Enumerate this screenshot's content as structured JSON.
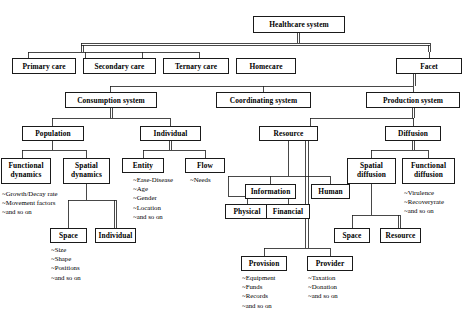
{
  "diagram": {
    "type": "tree-diagram",
    "nodes": {
      "healthcare_system": "Healthcare system",
      "primary_care": "Primary care",
      "secondary_care": "Secondary care",
      "ternary_care": "Ternary care",
      "homecare": "Homecare",
      "facet": "Facet",
      "consumption_system": "Consumption system",
      "coordinating_system": "Coordinating system",
      "production_system": "Production system",
      "population": "Population",
      "individual": "Individual",
      "resource": "Resource",
      "diffusion": "Diffusion",
      "functional_dynamics_l1": "Functional",
      "functional_dynamics_l2": "dynamics",
      "spatial_dynamics_l1": "Spatial",
      "spatial_dynamics_l2": "dynamics",
      "entity": "Entity",
      "flow": "Flow",
      "spatial_diffusion_l1": "Spatial",
      "spatial_diffusion_l2": "diffusion",
      "functional_diffusion_l1": "Functional",
      "functional_diffusion_l2": "diffusion",
      "space_left": "Space",
      "individual_leaf": "Individual",
      "information": "Information",
      "human": "Human",
      "physical": "Physical",
      "financial": "Financial",
      "space_right": "Space",
      "resource_leaf": "Resource",
      "provision": "Provision",
      "provider": "Provider"
    },
    "attribute_lists": {
      "functional_dynamics": [
        "~Growth/Decay rate",
        "~Movement factors",
        "~and so on"
      ],
      "entity": [
        "~Ease-Disease",
        "~Age",
        "~Gender",
        "~Location",
        "~and so on"
      ],
      "flow": [
        "~Needs"
      ],
      "functional_diffusion": [
        "~Virulence",
        "~Recoveryrate",
        "~and so on"
      ],
      "space_left": [
        "~Size",
        "~Shape",
        "~Positions",
        "~and so on"
      ],
      "provision": [
        "~Equipment",
        "~Funds",
        "~Records",
        "~and so on"
      ],
      "provider": [
        "~Taxation",
        "~Donation",
        "~and so on"
      ]
    }
  }
}
